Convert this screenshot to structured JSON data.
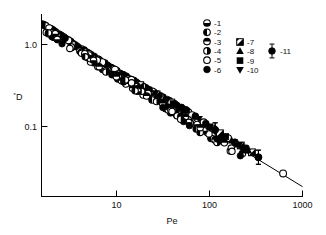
{
  "figure": {
    "title": "",
    "background": "#ffffff",
    "line_color": "#000000",
    "marker_color": "#000000"
  },
  "axes": {
    "x": {
      "label": "Pe",
      "scale": "log",
      "min": 2,
      "max": 1000,
      "tick_values": [
        10,
        100,
        1000
      ],
      "tick_labels": [
        "10",
        "100",
        "1000"
      ]
    },
    "y": {
      "label": "D",
      "label_prefix": "*",
      "scale": "log",
      "min": 0.02,
      "max": 2.6,
      "tick_values": [
        1.0,
        0.1
      ],
      "tick_labels": [
        "1.0",
        "0.1"
      ]
    }
  },
  "legend": {
    "column1": [
      {
        "key": "1",
        "label": "-1",
        "marker": "circle-half-bottom-filled"
      },
      {
        "key": "2",
        "label": "-2",
        "marker": "circle-half-left-filled"
      },
      {
        "key": "3",
        "label": "-3",
        "marker": "circle-half-bottom-open"
      },
      {
        "key": "4",
        "label": "-4",
        "marker": "circle-half-right-filled"
      },
      {
        "key": "5",
        "label": "-5",
        "marker": "circle-open"
      },
      {
        "key": "6",
        "label": "-6",
        "marker": "circle-filled"
      }
    ],
    "column2": [
      {
        "key": "7",
        "label": "-7",
        "marker": "square-diagonal-filled"
      },
      {
        "key": "8",
        "label": "-8",
        "marker": "triangle-up-filled"
      },
      {
        "key": "9",
        "label": "-9",
        "marker": "square-filled"
      },
      {
        "key": "10",
        "label": "-10",
        "marker": "triangle-down-filled"
      }
    ],
    "column3": [
      {
        "key": "11",
        "label": "-11",
        "marker": "circle-filled-errorbar"
      }
    ]
  },
  "chart_data": {
    "type": "scatter",
    "title": "",
    "xlabel": "Pe",
    "ylabel": "*D",
    "xscale": "log",
    "yscale": "log",
    "xlim": [
      2,
      1000
    ],
    "ylim": [
      0.02,
      2.6
    ],
    "grid": false,
    "legend_position": "top-right",
    "fit_line": {
      "name": "power-law fit",
      "equation": "D = 3.0 * Pe^-0.72",
      "x": [
        2,
        1000
      ],
      "y": [
        1.85,
        0.026
      ]
    },
    "series": [
      {
        "name": "-1",
        "marker": "circle-half-bottom-filled",
        "points": [
          [
            2.1,
            1.95
          ],
          [
            2.3,
            1.82
          ],
          [
            2.6,
            1.7
          ],
          [
            3.0,
            1.52
          ],
          [
            3.4,
            1.4
          ],
          [
            4.2,
            1.18
          ],
          [
            5.2,
            1.02
          ],
          [
            6.5,
            0.87
          ],
          [
            8.0,
            0.75
          ],
          [
            9.5,
            0.66
          ]
        ]
      },
      {
        "name": "-2",
        "marker": "circle-half-left-filled",
        "points": [
          [
            2.2,
            1.9
          ],
          [
            2.8,
            1.6
          ],
          [
            3.6,
            1.33
          ],
          [
            4.6,
            1.1
          ],
          [
            6.0,
            0.92
          ],
          [
            7.6,
            0.78
          ],
          [
            10.5,
            0.62
          ],
          [
            13.0,
            0.53
          ],
          [
            16.0,
            0.46
          ],
          [
            20.0,
            0.4
          ]
        ]
      },
      {
        "name": "-3",
        "marker": "circle-half-bottom-open",
        "points": [
          [
            2.5,
            1.74
          ],
          [
            3.2,
            1.46
          ],
          [
            4.0,
            1.24
          ],
          [
            5.5,
            0.99
          ],
          [
            7.0,
            0.83
          ],
          [
            9.0,
            0.7
          ],
          [
            12.0,
            0.57
          ],
          [
            15.0,
            0.49
          ],
          [
            19.0,
            0.42
          ],
          [
            24.0,
            0.36
          ]
        ]
      },
      {
        "name": "-4",
        "marker": "circle-half-right-filled",
        "points": [
          [
            3.1,
            1.49
          ],
          [
            4.4,
            1.14
          ],
          [
            5.8,
            0.94
          ],
          [
            7.8,
            0.77
          ],
          [
            11.0,
            0.6
          ],
          [
            14.0,
            0.51
          ],
          [
            18.0,
            0.44
          ],
          [
            23.0,
            0.37
          ],
          [
            29.0,
            0.32
          ],
          [
            36.0,
            0.28
          ]
        ]
      },
      {
        "name": "-5",
        "marker": "circle-open",
        "points": [
          [
            2.4,
            1.78
          ],
          [
            3.8,
            1.29
          ],
          [
            6.2,
            0.9
          ],
          [
            8.5,
            0.72
          ],
          [
            11.5,
            0.59
          ],
          [
            17.0,
            0.45
          ],
          [
            22.0,
            0.38
          ],
          [
            28.0,
            0.33
          ],
          [
            34.0,
            0.29
          ],
          [
            42.0,
            0.255
          ],
          [
            50.0,
            0.225
          ],
          [
            58.0,
            0.205
          ],
          [
            66.0,
            0.19
          ],
          [
            72.0,
            0.175
          ],
          [
            95.0,
            0.145
          ],
          [
            120.0,
            0.122
          ],
          [
            170.0,
            0.095
          ],
          [
            260.0,
            0.072
          ],
          [
            630.0,
            0.037
          ]
        ]
      },
      {
        "name": "-6",
        "marker": "circle-filled",
        "points": [
          [
            2.0,
            2.0
          ],
          [
            2.7,
            1.66
          ],
          [
            3.5,
            1.36
          ],
          [
            4.8,
            1.07
          ],
          [
            6.8,
            0.84
          ],
          [
            9.8,
            0.65
          ],
          [
            13.5,
            0.52
          ],
          [
            19.5,
            0.41
          ],
          [
            26.0,
            0.345
          ],
          [
            33.0,
            0.295
          ],
          [
            40.0,
            0.265
          ],
          [
            48.0,
            0.235
          ],
          [
            56.0,
            0.215
          ],
          [
            63.0,
            0.2
          ],
          [
            78.0,
            0.17
          ],
          [
            100.0,
            0.14
          ],
          [
            125.0,
            0.118
          ],
          [
            200.0,
            0.085
          ],
          [
            350.0,
            0.057
          ]
        ]
      },
      {
        "name": "-7",
        "marker": "square-diagonal-filled",
        "points": [
          [
            21.0,
            0.39
          ],
          [
            31.0,
            0.305
          ],
          [
            44.0,
            0.245
          ],
          [
            140.0,
            0.108
          ],
          [
            230.0,
            0.078
          ],
          [
            300.0,
            0.065
          ]
        ]
      },
      {
        "name": "-8",
        "marker": "triangle-up-filled",
        "points": [
          [
            25.0,
            0.355
          ],
          [
            38.0,
            0.275
          ],
          [
            52.0,
            0.222
          ],
          [
            150.0,
            0.103
          ],
          [
            185.0,
            0.089
          ],
          [
            215.0,
            0.08
          ],
          [
            245.0,
            0.074
          ],
          [
            275.0,
            0.068
          ]
        ]
      },
      {
        "name": "-9",
        "marker": "square-filled",
        "points": [
          [
            46.0,
            0.238
          ],
          [
            60.0,
            0.202
          ],
          [
            110.0,
            0.128
          ],
          [
            160.0,
            0.099
          ],
          [
            255.0,
            0.072
          ]
        ]
      },
      {
        "name": "-10",
        "marker": "triangle-down-filled",
        "points": [
          [
            30.0,
            0.312
          ],
          [
            54.0,
            0.216
          ],
          [
            85.0,
            0.158
          ],
          [
            195.0,
            0.086
          ],
          [
            222.0,
            0.079
          ]
        ]
      },
      {
        "name": "-11",
        "marker": "circle-filled-errorbar",
        "points": [
          [
            125.0,
            0.118
          ],
          [
            350.0,
            0.057
          ]
        ],
        "error_bars": true
      }
    ]
  }
}
